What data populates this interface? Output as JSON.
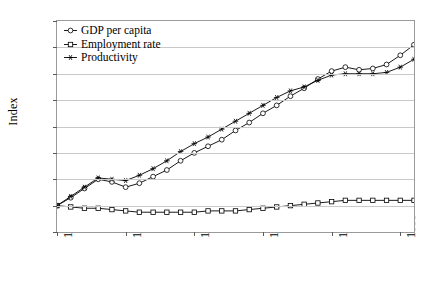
{
  "chart_data": {
    "type": "line",
    "title": "",
    "xlabel": "",
    "ylabel": "Index",
    "xlim": [
      1970,
      1996
    ],
    "ylim": [
      80,
      240
    ],
    "ytick_values": [
      80,
      100,
      120,
      140,
      160,
      180,
      200,
      220,
      240
    ],
    "ytick_labels": [
      "80",
      "100",
      "120",
      "140",
      "160",
      "180",
      "200",
      "220",
      "240"
    ],
    "xtick_values": [
      1970,
      1975,
      1980,
      1985,
      1990,
      1995
    ],
    "xtick_labels": [
      "1970",
      "1975",
      "1980",
      "1985",
      "1990",
      "1995"
    ],
    "grid": "horizontal",
    "legend_position": "top-left-inside",
    "x": [
      1970,
      1971,
      1972,
      1973,
      1974,
      1975,
      1976,
      1977,
      1978,
      1979,
      1980,
      1981,
      1982,
      1983,
      1984,
      1985,
      1986,
      1987,
      1988,
      1989,
      1990,
      1991,
      1992,
      1993,
      1994,
      1995,
      1996
    ],
    "series": [
      {
        "name": "GDP per capita",
        "marker": "open-circle",
        "color": "#000000",
        "values": [
          100,
          106,
          113,
          120,
          118,
          114,
          117,
          122,
          127,
          134,
          140,
          145,
          150,
          157,
          163,
          170,
          176,
          183,
          189,
          196,
          202,
          205,
          203,
          204,
          207,
          214,
          222
        ]
      },
      {
        "name": "Employment rate",
        "marker": "open-square",
        "color": "#000000",
        "values": [
          100,
          99,
          98,
          98,
          97,
          96,
          95,
          95,
          95,
          95,
          95,
          96,
          96,
          96,
          97,
          98,
          99,
          100,
          101,
          102,
          103,
          104,
          104,
          104,
          104,
          104,
          104
        ]
      },
      {
        "name": "Productivity",
        "marker": "asterisk",
        "color": "#000000",
        "values": [
          100,
          107,
          114,
          121,
          120,
          119,
          123,
          128,
          134,
          141,
          147,
          152,
          158,
          164,
          170,
          176,
          182,
          187,
          190,
          195,
          199,
          200,
          200,
          200,
          201,
          205,
          211
        ]
      }
    ]
  }
}
